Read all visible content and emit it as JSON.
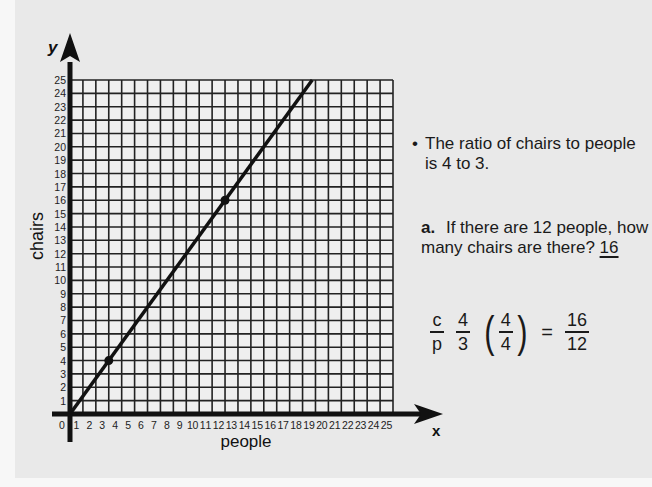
{
  "chart_data": {
    "type": "line",
    "title": "",
    "xlabel": "people",
    "ylabel": "chairs",
    "x_axis_letter": "x",
    "y_axis_letter": "y",
    "xlim": [
      0,
      25
    ],
    "ylim": [
      0,
      25
    ],
    "grid": true,
    "x_ticks": [
      0,
      1,
      2,
      3,
      4,
      5,
      6,
      7,
      8,
      9,
      10,
      11,
      12,
      13,
      14,
      15,
      16,
      17,
      18,
      19,
      20,
      21,
      22,
      23,
      24,
      25
    ],
    "y_ticks": [
      1,
      2,
      3,
      4,
      5,
      6,
      7,
      8,
      9,
      10,
      11,
      12,
      13,
      14,
      15,
      16,
      17,
      18,
      19,
      20,
      21,
      22,
      23,
      24,
      25
    ],
    "series": [
      {
        "name": "chairs = 4/3 × people",
        "x": [
          0,
          18.75
        ],
        "y": [
          0,
          25
        ],
        "marked_points": [
          {
            "x": 3,
            "y": 4
          },
          {
            "x": 12,
            "y": 16
          }
        ]
      }
    ]
  },
  "text": {
    "bullet": "The ratio of chairs to people is 4 to 3.",
    "question_letter": "a.",
    "question": "If there are 12 people, how many chairs are there?",
    "answer": "16"
  },
  "equation": {
    "lhs_num": "c",
    "lhs_den": "p",
    "ratio_num": "4",
    "ratio_den": "3",
    "factor_num": "4",
    "factor_den": "4",
    "equals": "=",
    "result_num": "16",
    "result_den": "12"
  }
}
